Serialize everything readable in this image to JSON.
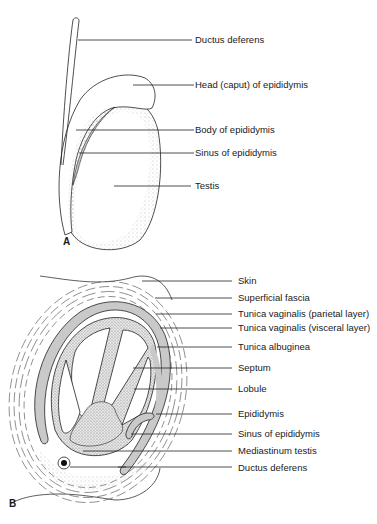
{
  "figure": {
    "panel_a": {
      "letter": "A",
      "labels": [
        {
          "text": "Ductus deferens",
          "y": 37
        },
        {
          "text": "Head (caput) of epididymis",
          "y": 82
        },
        {
          "text": "Body of epididymis",
          "y": 127
        },
        {
          "text": "Sinus of epididymis",
          "y": 149
        },
        {
          "text": "Testis",
          "y": 183
        }
      ]
    },
    "panel_b": {
      "letter": "B",
      "labels": [
        {
          "text": "Skin",
          "y": 279
        },
        {
          "text": "Superficial fascia",
          "y": 296
        },
        {
          "text": "Tunica vaginalis (parietal layer)",
          "y": 313
        },
        {
          "text": "Tunica vaginalis (visceral layer)",
          "y": 326
        },
        {
          "text": "Tunica albuginea",
          "y": 345
        },
        {
          "text": "Septum",
          "y": 366
        },
        {
          "text": "Lobule",
          "y": 387
        },
        {
          "text": "Epididymis",
          "y": 412
        },
        {
          "text": "Sinus of epididymis",
          "y": 432
        },
        {
          "text": "Mediastinum testis",
          "y": 449
        },
        {
          "text": "Ductus deferens",
          "y": 466
        }
      ]
    },
    "colors": {
      "line": "#222222",
      "shade": "#c9c9c9",
      "stipple": "#888888"
    }
  }
}
